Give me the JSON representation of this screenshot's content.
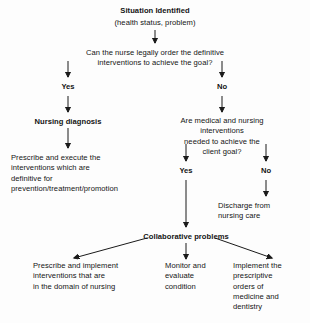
{
  "diagram": {
    "title": "Situation Identified",
    "subtitle": "(health status, problem)",
    "question_1": "Can the nurse legally order the definitive interventions to achieve the goal?",
    "branch_yes_1": "Yes",
    "branch_no_1": "No",
    "nursing_diagnosis": "Nursing diagnosis",
    "nursing_actions": "Prescribe and execute the\ninterventions which are\ndefinitive for\nprevention/treatment/promotion",
    "question_2": "Are medical and nursing interventions\nneeded to achieve the client goal?",
    "branch_yes_2": "Yes",
    "branch_no_2": "No",
    "discharge": "Discharge from\nnursing care",
    "collaborative": "Collaborative problems",
    "outcome_left": "Prescribe and implement\ninterventions that are\nin the domain of nursing",
    "outcome_middle": "Monitor and\nevaluate\ncondition",
    "outcome_right": "Implement the\nprescriptive\norders of\nmedicine and\ndentistry",
    "stroke_color": "#1a1a1a",
    "background_color": "#fdfdfd"
  }
}
